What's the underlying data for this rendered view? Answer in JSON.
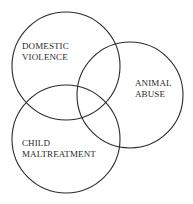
{
  "diagram": {
    "type": "venn",
    "background": "#ffffff",
    "stroke_color": "#2b2b2b",
    "sets": [
      {
        "id": "domestic-violence",
        "lines": [
          "DOMESTIC",
          "VIOLENCE"
        ],
        "cx": 66,
        "cy": 66,
        "r": 54
      },
      {
        "id": "animal-abuse",
        "lines": [
          "ANIMAL",
          "ABUSE"
        ],
        "cx": 130,
        "cy": 95,
        "r": 53
      },
      {
        "id": "child-maltreatment",
        "lines": [
          "CHILD",
          "MALTREATMENT"
        ],
        "cx": 66,
        "cy": 139,
        "r": 54
      }
    ]
  }
}
